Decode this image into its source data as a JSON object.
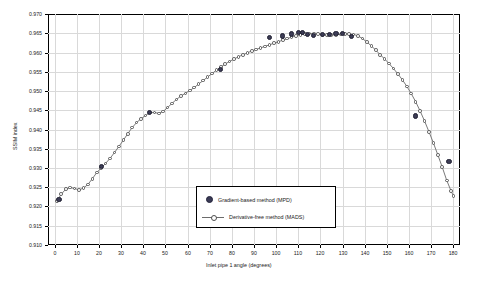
{
  "chart_data": {
    "type": "line",
    "title": "",
    "xlabel": "Inlet pipe 1 angle (degrees)",
    "ylabel": "SSIM index",
    "xlim": [
      -3,
      183
    ],
    "ylim": [
      0.91,
      0.97
    ],
    "xticks": [
      0,
      10,
      20,
      30,
      40,
      50,
      60,
      70,
      80,
      90,
      100,
      110,
      120,
      130,
      140,
      150,
      160,
      170,
      180
    ],
    "yticks": [
      0.91,
      0.915,
      0.92,
      0.925,
      0.93,
      0.935,
      0.94,
      0.945,
      0.95,
      0.955,
      0.96,
      0.965,
      0.97
    ],
    "ytick_labels": [
      "0.910",
      "0.915",
      "0.920",
      "0.925",
      "0.930",
      "0.935",
      "0.940",
      "0.945",
      "0.950",
      "0.955",
      "0.960",
      "0.965",
      "0.970"
    ],
    "xtick_labels": [
      "0",
      "10",
      "20",
      "30",
      "40",
      "50",
      "60",
      "70",
      "80",
      "90",
      "100",
      "110",
      "120",
      "130",
      "140",
      "150",
      "160",
      "170",
      "180"
    ],
    "grid": true,
    "legend_position": "center",
    "legend": [
      {
        "label": "Gradient-based method (MPD)",
        "marker": "filled-circle",
        "color": "#3c3c55"
      },
      {
        "label": "Derivative-free method (MADS)",
        "marker": "open-circle-line",
        "color": "#6b6b6b"
      }
    ],
    "series": [
      {
        "name": "Derivative-free method (MADS)",
        "marker": "open-circle",
        "x": [
          1,
          3,
          5,
          7,
          9,
          11,
          13,
          15,
          17,
          19,
          21,
          23,
          25,
          27,
          29,
          31,
          33,
          35,
          37,
          39,
          41,
          43,
          45,
          47,
          49,
          51,
          53,
          55,
          57,
          59,
          61,
          63,
          65,
          67,
          69,
          71,
          73,
          75,
          77,
          79,
          81,
          83,
          85,
          87,
          89,
          91,
          93,
          95,
          97,
          99,
          101,
          103,
          105,
          107,
          109,
          111,
          113,
          115,
          117,
          119,
          121,
          123,
          125,
          127,
          129,
          131,
          133,
          135,
          137,
          139,
          141,
          143,
          145,
          147,
          149,
          151,
          153,
          155,
          157,
          159,
          161,
          163,
          165,
          167,
          169,
          171,
          173,
          175,
          177,
          179,
          180
        ],
        "y": [
          0.9215,
          0.9232,
          0.9245,
          0.9249,
          0.9247,
          0.9243,
          0.9248,
          0.9257,
          0.9272,
          0.9288,
          0.93,
          0.9312,
          0.9325,
          0.934,
          0.9356,
          0.9372,
          0.9389,
          0.9405,
          0.9418,
          0.9428,
          0.9436,
          0.9444,
          0.9444,
          0.9442,
          0.9447,
          0.9457,
          0.9468,
          0.9478,
          0.9487,
          0.9494,
          0.9501,
          0.9509,
          0.9518,
          0.9527,
          0.9536,
          0.9545,
          0.9554,
          0.9562,
          0.957,
          0.9577,
          0.9583,
          0.9589,
          0.9594,
          0.9599,
          0.9604,
          0.9608,
          0.9612,
          0.9616,
          0.962,
          0.9624,
          0.9628,
          0.9632,
          0.9636,
          0.964,
          0.9643,
          0.9646,
          0.9648,
          0.9649,
          0.9649,
          0.9648,
          0.9646,
          0.9645,
          0.9645,
          0.9646,
          0.9647,
          0.9648,
          0.9648,
          0.9647,
          0.9643,
          0.9636,
          0.9627,
          0.9617,
          0.9606,
          0.9594,
          0.9583,
          0.9571,
          0.9558,
          0.9544,
          0.9529,
          0.9512,
          0.9493,
          0.9472,
          0.9448,
          0.9422,
          0.9394,
          0.9365,
          0.9334,
          0.9302,
          0.9268,
          0.924,
          0.9228
        ]
      },
      {
        "name": "Gradient-based method (MPD)",
        "marker": "filled-circle",
        "x": [
          2,
          21,
          43,
          75,
          97,
          103,
          107,
          110,
          112,
          114,
          117,
          121,
          124,
          127,
          130,
          134,
          163,
          178
        ],
        "y": [
          0.9218,
          0.9303,
          0.9444,
          0.9556,
          0.9638,
          0.9643,
          0.9648,
          0.9652,
          0.9651,
          0.9647,
          0.9645,
          0.9646,
          0.9647,
          0.9649,
          0.9649,
          0.9641,
          0.9435,
          0.9317
        ]
      }
    ]
  }
}
